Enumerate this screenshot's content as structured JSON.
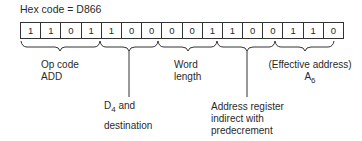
{
  "hex_code_label": "Hex code = D866",
  "bits": [
    "1",
    "1",
    "0",
    "1",
    "1",
    "0",
    "0",
    "0",
    "0",
    "1",
    "1",
    "0",
    "0",
    "1",
    "1",
    "0"
  ],
  "fields": {
    "opcode": {
      "line1": "Op code",
      "line2": "ADD"
    },
    "register": {
      "prefix": "D",
      "sub": "4",
      "suffix": " and",
      "line2": "destination"
    },
    "size": {
      "line1": "Word",
      "line2": "length"
    },
    "mode": {
      "line1": "Address register",
      "line2": "indirect with",
      "line3": "predecrement"
    },
    "ea": {
      "line1": "(Effective address)",
      "prefix": "A",
      "sub": "6"
    }
  }
}
